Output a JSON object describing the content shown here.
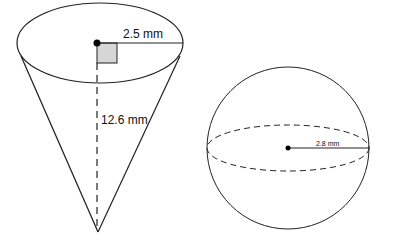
{
  "cone": {
    "radius_label": "2.5 mm",
    "height_label": "12.6 mm"
  },
  "sphere": {
    "radius_label": "2.8 mm"
  },
  "colors": {
    "stroke": "#222222",
    "right_angle_fill": "#d6d6d6"
  }
}
